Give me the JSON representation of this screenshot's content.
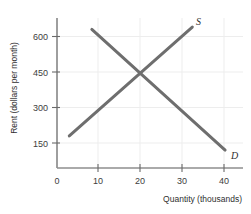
{
  "chart_data": {
    "type": "line",
    "title": "",
    "xlabel": "Quantity (thousands)",
    "ylabel": "Rent (dollars per month)",
    "xlim": [
      0,
      45
    ],
    "ylim": [
      0,
      680
    ],
    "xticks": [
      0,
      10,
      20,
      30,
      40
    ],
    "xtick_labels": [
      "0",
      "10",
      "20",
      "30",
      "40"
    ],
    "yticks": [
      150,
      300,
      450,
      600
    ],
    "ytick_labels": [
      "150",
      "300",
      "450",
      "600"
    ],
    "grid": true,
    "legend": "inline-endpoint-labels",
    "equilibrium": {
      "quantity": 20,
      "rent": 450
    },
    "series": [
      {
        "name": "S",
        "label": "S",
        "description": "Supply",
        "color": "#6e6e6e",
        "x": [
          3,
          33
        ],
        "y": [
          180,
          640
        ]
      },
      {
        "name": "D",
        "label": "D",
        "description": "Demand",
        "color": "#6e6e6e",
        "x": [
          8.5,
          41
        ],
        "y": [
          630,
          120
        ]
      }
    ]
  },
  "axes": {
    "x_title": "Quantity (thousands)",
    "y_title": "Rent (dollars per month)",
    "x_tick_0": "0",
    "x_tick_1": "10",
    "x_tick_2": "20",
    "x_tick_3": "30",
    "x_tick_4": "40",
    "y_tick_0": "150",
    "y_tick_1": "300",
    "y_tick_2": "450",
    "y_tick_3": "600"
  },
  "labels": {
    "supply": "S",
    "demand": "D"
  },
  "colors": {
    "curve": "#6e6e6e",
    "axis": "#6a6a6a",
    "grid": "#ededed",
    "text": "#3a3a3a",
    "background": "#ffffff"
  }
}
